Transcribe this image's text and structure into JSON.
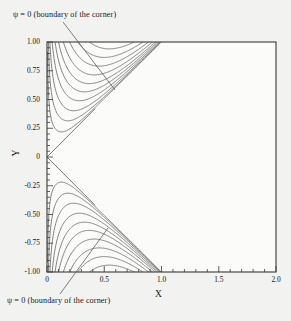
{
  "figure": {
    "annotations": [
      {
        "name": "psi-zero-top",
        "text": "ψ = 0 (boundary of the corner)"
      },
      {
        "name": "psi-zero-bottom",
        "text": "ψ = 0 (boundary of the corner)"
      }
    ],
    "colors": {
      "background": "#f2f2f0",
      "plot_background": "#fbfbfa",
      "frame": "#3a3a3a",
      "contour": "#6b6b6b",
      "leader": "#555555",
      "text": "#1a1a1a"
    }
  },
  "chart_data": {
    "type": "line",
    "title": "",
    "subtitle": "",
    "xlabel": "X",
    "ylabel": "Y",
    "xlim": [
      0,
      2.0
    ],
    "ylim": [
      -1.0,
      1.0
    ],
    "grid": false,
    "legend": null,
    "legend_position": "none",
    "xticks": [
      0,
      0.5,
      1.0,
      1.5,
      2.0
    ],
    "xticklabels": [
      "0",
      "0.5",
      "1.0",
      "1.5",
      "2.0"
    ],
    "yticks": [
      1.0,
      0.75,
      0.5,
      0.25,
      0,
      -0.25,
      -0.5,
      -0.75,
      -1.0
    ],
    "yticklabels": [
      "1.00",
      "0.75",
      "0.50",
      "0.25",
      "0",
      "-0.25",
      "-0.50",
      "-0.75",
      "-1.00"
    ],
    "minor_ticks_per_interval": 4,
    "contour_variable": "ψ",
    "contour_levels": [
      0,
      0.004,
      0.012,
      0.025,
      0.045,
      0.07,
      0.1,
      0.14,
      0.19,
      0.25,
      0.32,
      0.4,
      0.5,
      0.62,
      0.76,
      0.92,
      1.1,
      1.3,
      1.55,
      1.85,
      2.2,
      2.6,
      3.05,
      3.55,
      4.1,
      4.75,
      5.5,
      6.3
    ],
    "separatrix": {
      "label": "ψ = 0",
      "origin": [
        0,
        0
      ],
      "branches": [
        {
          "name": "upper",
          "from": [
            0,
            0
          ],
          "to": [
            0.42,
            0.42
          ]
        },
        {
          "name": "lower",
          "from": [
            0,
            0
          ],
          "to": [
            0.42,
            -0.42
          ]
        }
      ]
    },
    "series": [
      {
        "name": "ψ = 0 upper branch",
        "x": [
          0,
          0.42
        ],
        "y": [
          0,
          0.42
        ]
      },
      {
        "name": "ψ = 0 lower branch",
        "x": [
          0,
          0.42
        ],
        "y": [
          0,
          -0.42
        ]
      }
    ]
  }
}
